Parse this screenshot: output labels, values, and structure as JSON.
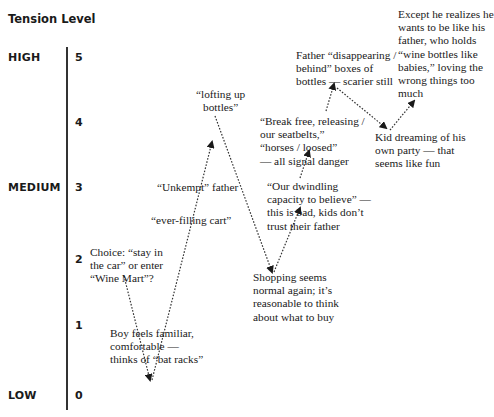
{
  "axis": {
    "title": "Tension Level",
    "levels": [
      {
        "label": "HIGH",
        "value": "5"
      },
      {
        "label": "",
        "value": "4"
      },
      {
        "label": "MEDIUM",
        "value": "3"
      },
      {
        "label": "",
        "value": "2"
      },
      {
        "label": "",
        "value": "1"
      },
      {
        "label": "LOW",
        "value": "0"
      }
    ]
  },
  "events": [
    {
      "id": "choice",
      "lines": [
        "Choice: “stay in",
        "the car” or enter",
        "“Wine Mart”?"
      ],
      "tension": 2
    },
    {
      "id": "boy-familiar",
      "lines": [
        "Boy feels familiar,",
        "comfortable —",
        "thinks of “bat racks”"
      ],
      "tension": 0
    },
    {
      "id": "ever-filling-cart",
      "lines": [
        "“ever-filling cart”"
      ],
      "tension": 2.7
    },
    {
      "id": "unkempt-father",
      "lines": [
        "“Unkempt” father"
      ],
      "tension": 3.1
    },
    {
      "id": "lofting-bottles",
      "lines": [
        "“lofting up",
        "bottles”"
      ],
      "tension": 4.2
    },
    {
      "id": "shopping-normal",
      "lines": [
        "Shopping seems",
        "normal again; it’s",
        "reasonable to think",
        "about what to buy"
      ],
      "tension": 2
    },
    {
      "id": "dwindling-capacity",
      "lines": [
        "“Our dwindling",
        "capacity to believe” —",
        "this is bad, kids don’t",
        "trust their father"
      ],
      "tension": 3
    },
    {
      "id": "break-free",
      "lines": [
        "“Break free, releasing /",
        "our seatbelts,”",
        "“horses / loosed”",
        "— all signal danger"
      ],
      "tension": 4
    },
    {
      "id": "father-disappearing",
      "lines": [
        "Father “disappearing /",
        "behind” boxes of",
        "bottles — scarier still"
      ],
      "tension": 4.8
    },
    {
      "id": "kid-dreaming",
      "lines": [
        "Kid dreaming of his",
        "own party — that",
        "seems like fun"
      ],
      "tension": 4
    },
    {
      "id": "except-realizes",
      "lines": [
        "Except he realizes he",
        "wants to be like his",
        "father, who holds",
        "“wine bottles like",
        "babies,” loving the",
        "wrong things too",
        "much"
      ],
      "tension": 5
    }
  ]
}
